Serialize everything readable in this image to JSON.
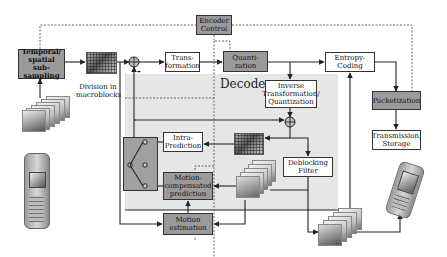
{
  "diagram": {
    "region_label": "Decoder",
    "blocks": {
      "temporal_spatial": "Temporal/ spatial sub-sampling",
      "division_caption": "Division in macroblocks",
      "transformation": "Trans- formation",
      "encoder_control": "Encoder Control",
      "quantization": "Quanti- zation",
      "entropy_coding": "Entropy- Coding",
      "packetization": "Packetization",
      "transmission_storage": "Transmission, Storage",
      "inverse_transform": "Inverse Transformation/ Quantization",
      "intra_prediction": "Intra- Prediction",
      "motion_comp_prediction": "Motion- compensated prediction",
      "deblocking_filter": "Deblocking Filter",
      "motion_estimation": "Motion estimation"
    },
    "sum_node_sign": "-",
    "colors": {
      "gray_block": "#9a9a9a",
      "white_block": "#ffffff",
      "decoder_bg": "#e6e6e6",
      "line": "#333333"
    }
  }
}
